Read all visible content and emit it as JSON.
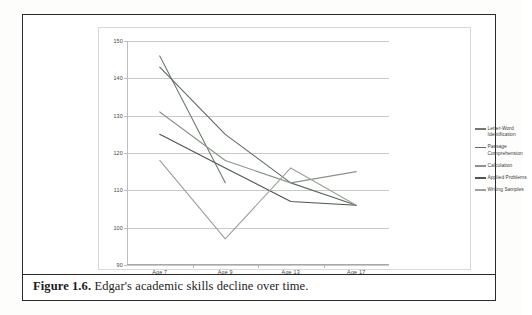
{
  "figure": {
    "caption_prefix": "Figure 1.6.",
    "caption_text": "Edgar's academic skills decline over time."
  },
  "chart_data": {
    "type": "line",
    "title": "",
    "xlabel": "",
    "ylabel": "",
    "categories": [
      "Age 7",
      "Age 9",
      "Age 13",
      "Age 17"
    ],
    "yticks": [
      90,
      100,
      110,
      120,
      130,
      140,
      150
    ],
    "ylim": [
      90,
      150
    ],
    "grid": true,
    "legend_position": "right",
    "series": [
      {
        "name": "Letter-Word Identification",
        "color": "#6e7b6e",
        "values": [
          146,
          112,
          null,
          null
        ]
      },
      {
        "name": "Passage Comprehension",
        "color": "#5f6a62",
        "values": [
          143,
          125,
          112,
          106
        ]
      },
      {
        "name": "Calculation",
        "color": "#8b9289",
        "values": [
          131,
          118,
          112,
          115
        ]
      },
      {
        "name": "Applied Problems",
        "color": "#4c564f",
        "values": [
          125,
          116,
          107,
          106
        ]
      },
      {
        "name": "Writing Samples",
        "color": "#9aa396",
        "values": [
          118,
          97,
          116,
          106
        ]
      }
    ]
  }
}
